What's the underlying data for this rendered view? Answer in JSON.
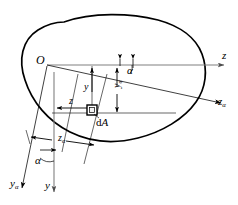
{
  "figure": {
    "type": "engineering-cross-section-diagram",
    "background_color": "#ffffff",
    "line_color": "#000000",
    "axis_color": "#808080"
  },
  "labels": {
    "origin": "O",
    "axis_z": "z",
    "axis_z_alpha_base": "z",
    "axis_z_alpha_sub": "α",
    "axis_y_bottom": "y",
    "axis_y_alpha_base": "y",
    "axis_y_alpha_sub": "α",
    "angle_top": "α",
    "angle_bottom": "α",
    "coord_y_base": "y",
    "coord_y_sub": "",
    "coord_y_alpha_base": "y",
    "coord_y_alpha_sub": "α",
    "coord_z_base": "z",
    "coord_z_alpha_base": "z",
    "coord_z_alpha_sub": "α",
    "element_dA_d": "d",
    "element_dA_A": "A"
  },
  "geometry": {
    "origin_point": {
      "x": 47,
      "y": 65
    },
    "element_point": {
      "x": 92,
      "y": 110
    },
    "rotation_angle_deg": 12,
    "z_axis_end": {
      "x": 228,
      "y": 65
    },
    "z_alpha_axis_end": {
      "x": 225,
      "y": 105
    },
    "y_axis_end": {
      "x": 55,
      "y": 196
    },
    "y_alpha_axis_end": {
      "x": 22,
      "y": 192
    }
  }
}
